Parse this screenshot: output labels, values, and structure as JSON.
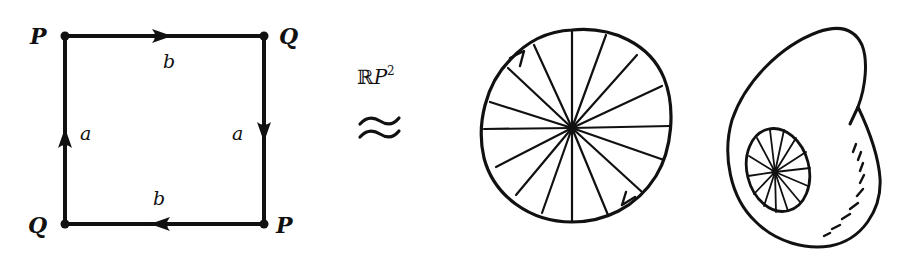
{
  "square": {
    "corners": {
      "top_left": "P",
      "top_right": "Q",
      "bottom_left": "Q",
      "bottom_right": "P"
    },
    "edges": {
      "top": "b",
      "bottom": "b",
      "left": "a",
      "right": "a"
    },
    "arrow_directions": {
      "top": "right",
      "right": "down",
      "bottom": "left",
      "left": "up"
    }
  },
  "relation": {
    "space_label_prefix": "ℝ",
    "space_label_letter": "P",
    "space_label_exponent": "2",
    "symbol": "≈"
  },
  "disk": {
    "spokes": 18,
    "boundary_arrows": 2
  },
  "surface": {
    "description": "cross-cap surface with embedded disk",
    "inner_disk_spokes": 14
  },
  "colors": {
    "ink": "#111111",
    "background": "#ffffff"
  }
}
